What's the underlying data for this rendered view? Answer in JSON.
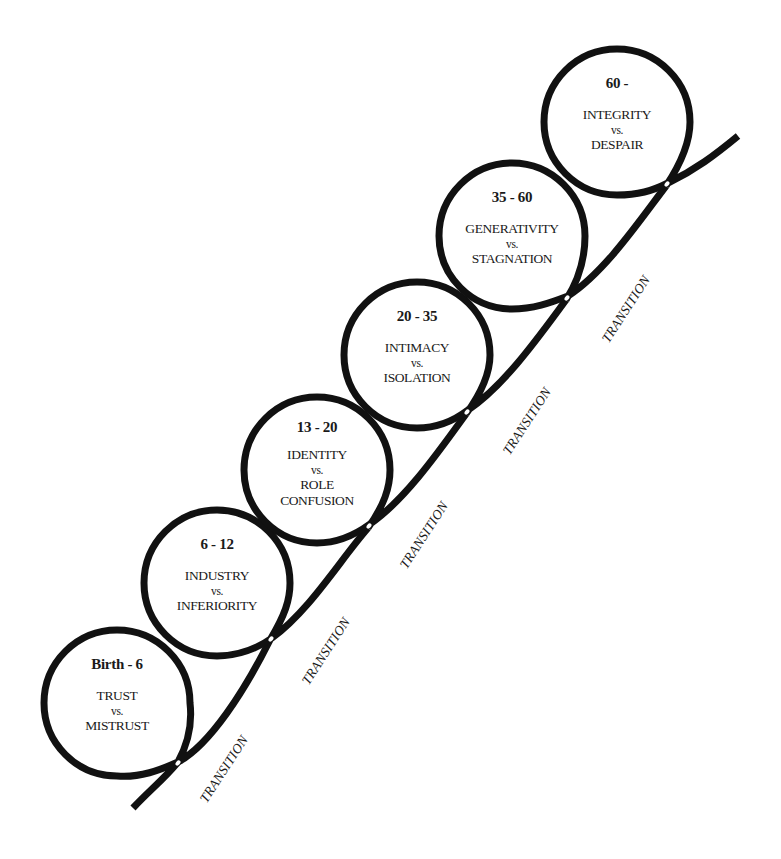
{
  "diagram": {
    "title": "",
    "stroke_color": "#111111",
    "stages": [
      {
        "age": "Birth - 6",
        "positive": "TRUST",
        "vs": "vs.",
        "negative": [
          "MISTRUST"
        ],
        "cx": 117,
        "cy": 703
      },
      {
        "age": "6 - 12",
        "positive": "INDUSTRY",
        "vs": "vs.",
        "negative": [
          "INFERIORITY"
        ],
        "cx": 217,
        "cy": 583
      },
      {
        "age": "13 - 20",
        "positive": "IDENTITY",
        "vs": "vs.",
        "negative": [
          "ROLE",
          "CONFUSION"
        ],
        "cx": 317,
        "cy": 470
      },
      {
        "age": "20 - 35",
        "positive": "INTIMACY",
        "vs": "vs.",
        "negative": [
          "ISOLATION"
        ],
        "cx": 417,
        "cy": 355
      },
      {
        "age": "35 - 60",
        "positive": "GENERATIVITY",
        "vs": "vs.",
        "negative": [
          "STAGNATION"
        ],
        "cx": 512,
        "cy": 236
      },
      {
        "age": "60 -",
        "positive": "INTEGRITY",
        "vs": "vs.",
        "negative": [
          "DESPAIR"
        ],
        "cx": 617,
        "cy": 122
      }
    ],
    "transitions": [
      {
        "label": "TRANSITION"
      },
      {
        "label": "TRANSITION"
      },
      {
        "label": "TRANSITION"
      },
      {
        "label": "TRANSITION"
      },
      {
        "label": "TRANSITION"
      },
      {
        "label": "TRANSITION"
      }
    ]
  }
}
